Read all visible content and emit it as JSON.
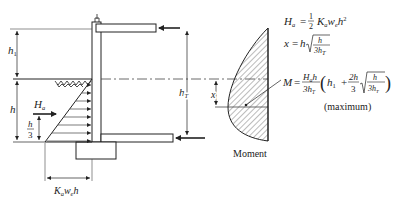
{
  "diagram": {
    "type": "cantilever retaining wall with anchored top, earth pressure and moment diagram",
    "labels": {
      "h1": "h",
      "h1_sub": "1",
      "h": "h",
      "Ha": "H",
      "Ha_sub": "a",
      "h_over_3_num": "h",
      "h_over_3_den": "3",
      "hT": "h",
      "hT_sub": "T",
      "x": "x",
      "base_width": "K",
      "base_width_a": "a",
      "base_width_w": "w",
      "base_width_e": "e",
      "base_width_h": "h",
      "moment_caption": "Moment"
    },
    "equations": {
      "eq1": {
        "lhs": "H",
        "lhs_sub": "a",
        "eq": "=",
        "frac_num": "1",
        "frac_den": "2",
        "rhs": "K",
        "rhs_a": "a",
        "rhs_w": "w",
        "rhs_e": "e",
        "rhs_h": "h",
        "rhs_exp": "2"
      },
      "eq2": {
        "lhs": "x",
        "eq": "=",
        "rhs_h": "h",
        "sqrt_num": "h",
        "sqrt_den": "3h",
        "sqrt_den_sub": "T"
      },
      "eq3": {
        "lhs": "M",
        "eq": "=",
        "frac_num": "H",
        "frac_num_sub": "a",
        "frac_num_h": "h",
        "frac_den": "3h",
        "frac_den_sub": "T",
        "term1": "h",
        "term1_sub": "1",
        "plus": "+",
        "frac2_num": "2h",
        "frac2_den": "3",
        "sqrt_num": "h",
        "sqrt_den": "3h",
        "sqrt_den_sub": "T"
      },
      "note": "(maximum)"
    },
    "colors": {
      "line": "#222222",
      "hatch": "#555555",
      "dash": "#444444"
    }
  }
}
